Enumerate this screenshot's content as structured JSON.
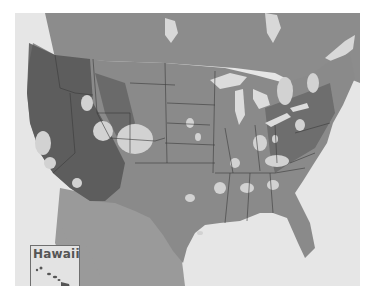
{
  "map": {
    "type": "grayscale continental US raster map with state boundaries",
    "colors": {
      "background": "#ffffff",
      "water": "#e6e6e6",
      "land_base": "#8a8a8a",
      "land_dark": "#4f4f4f",
      "bright_patches": "#d2d2d2",
      "state_borders": "#3a3a3a",
      "inset_border": "#6f6f6f"
    },
    "inset": {
      "label": "Hawaii"
    }
  }
}
